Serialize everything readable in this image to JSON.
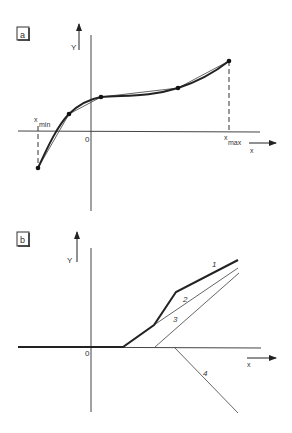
{
  "header_fragment": "... graph of ... integral ... (cut off text at top)",
  "panel_a": {
    "tag": "a",
    "y_label": "Y",
    "x_label": "x",
    "origin_label": "0",
    "x_min_label": "x",
    "x_min_sub": "min",
    "x_max_label": "x",
    "x_max_sub": "max",
    "description": "Smooth curve (thick) approximated by piecewise-linear segments (thin) through 5 nodes from x_min to x_max"
  },
  "panel_b": {
    "tag": "b",
    "y_label": "Y",
    "x_label": "x",
    "origin_label": "0",
    "line_labels": [
      "1",
      "2",
      "3",
      "4"
    ],
    "description": "Piecewise-linear function (line 1, thick) as sum of ramp functions 2, 3 and negative ramp 4"
  },
  "colors": {
    "ink": "#222222",
    "thin_ink": "#555555",
    "background": "#ffffff"
  }
}
